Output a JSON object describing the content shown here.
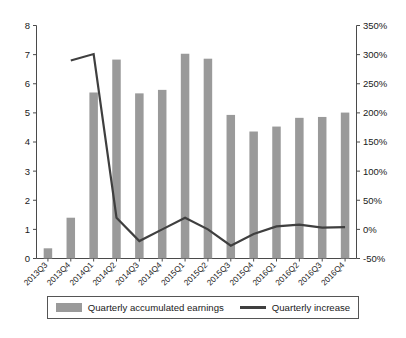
{
  "chart_data": {
    "type": "bar",
    "title": "",
    "subtitle": "",
    "xlabel": "",
    "ylabel": "",
    "grid": false,
    "legend_position": "bottom",
    "categories": [
      "2013Q3",
      "2013Q4",
      "2014Q1",
      "2014Q2",
      "2014Q3",
      "2014Q4",
      "2015Q1",
      "2015Q2",
      "2015Q3",
      "2015Q4",
      "2016Q1",
      "2016Q2",
      "2016Q3",
      "2016Q4"
    ],
    "axes": {
      "left": {
        "label": "",
        "ylim": [
          0,
          8
        ],
        "ticks": [
          0,
          1,
          2,
          3,
          4,
          5,
          6,
          7,
          8
        ],
        "tick_labels": [
          "0",
          "1",
          "2",
          "3",
          "4",
          "5",
          "6",
          "7",
          "8"
        ]
      },
      "right": {
        "label": "",
        "ylim": [
          -50,
          350
        ],
        "ticks": [
          -50,
          0,
          50,
          100,
          150,
          200,
          250,
          300,
          350
        ],
        "tick_labels": [
          "-50%",
          "0%",
          "50%",
          "100%",
          "150%",
          "200%",
          "250%",
          "300%",
          "350%"
        ]
      }
    },
    "series": [
      {
        "name": "Quarterly accumulated earnings",
        "type": "bar",
        "axis": "left",
        "color": "#9a9a9a",
        "values": [
          0.35,
          1.4,
          5.7,
          6.83,
          5.67,
          5.79,
          7.03,
          6.86,
          4.93,
          4.36,
          4.53,
          4.83,
          4.86,
          5.01
        ]
      },
      {
        "name": "Quarterly increase",
        "type": "line",
        "axis": "right",
        "color": "#3f3f3f",
        "values": [
          null,
          290,
          301,
          20,
          -20,
          0,
          20,
          0,
          -28,
          -8,
          5,
          8,
          3,
          4
        ]
      }
    ]
  },
  "legend": {
    "items": [
      {
        "label": "Quarterly accumulated earnings",
        "marker": "bar-swatch"
      },
      {
        "label": "Quarterly increase",
        "marker": "line-swatch"
      }
    ]
  }
}
